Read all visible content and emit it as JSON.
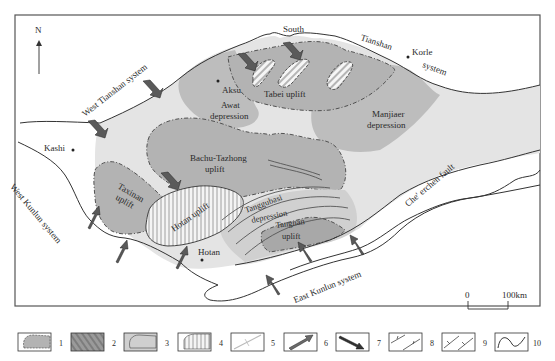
{
  "map": {
    "north_label": "N",
    "scale": {
      "start": "0",
      "end": "100km"
    },
    "colors": {
      "background": "#ffffff",
      "basin_light": "#e6e6e6",
      "depression": "#bdbdbd",
      "uplift": "#b3b3b3",
      "uplift_hatched": "#f2f2f2",
      "frame": "#555555",
      "arrow": "#5a5a5a",
      "boundary": "#333333"
    },
    "labels": {
      "south": "South",
      "tianshan": "Tianshan",
      "korle": "Korle",
      "system": "system",
      "west_tianshan": "West Tianshan system",
      "aksu": "Aksu",
      "awat": "Awat",
      "awat_dep": "depression",
      "tabei": "Tabei uplift",
      "manjiaer": "Manjiaer",
      "manjiaer_dep": "depression",
      "kashi": "Kashi",
      "bachu": "Bachu-Tazhong",
      "bachu_uplift": "uplift",
      "taxinan": "Taxinan",
      "taxinan_uplift": "uplift",
      "hotan_uplift": "Hotan uplift",
      "hotan": "Hotan",
      "tanggubasi": "Tanggubasi",
      "tanggubasi_dep": "depression",
      "tangnan": "Tangnan",
      "tangnan_uplift": "uplift",
      "west_kunlun": "West Kunlun system",
      "east_kunlun": "East Kunlun system",
      "checrchen": "Che' erchen fault"
    }
  },
  "legend": [
    {
      "num": "1",
      "desc": "uplift"
    },
    {
      "num": "2",
      "desc": "fault zone"
    },
    {
      "num": "3",
      "desc": "depression"
    },
    {
      "num": "4",
      "desc": "hatched uplift"
    },
    {
      "num": "5",
      "desc": "line"
    },
    {
      "num": "6",
      "desc": "arrow NE"
    },
    {
      "num": "7",
      "desc": "arrow SE"
    },
    {
      "num": "8",
      "desc": "thrust fault"
    },
    {
      "num": "9",
      "desc": "normal fault"
    },
    {
      "num": "10",
      "desc": "boundary"
    }
  ]
}
